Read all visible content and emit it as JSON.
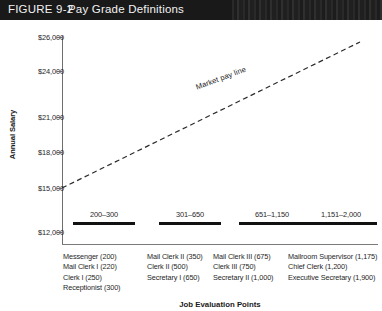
{
  "header": {
    "figure_label": "FIGURE 9-2",
    "title": "Pay Grade Definitions"
  },
  "chart_data": {
    "type": "scatter",
    "title": "Pay Grade Definitions",
    "xlabel": "Job Evaluation Points",
    "ylabel": "Annual Salary",
    "grid": false,
    "legend": false,
    "yticks": [
      "$26,000",
      "$24,000",
      "$21,000",
      "$18,000",
      "$15,000",
      "$12,000"
    ],
    "ytick_values": [
      26000,
      24000,
      21000,
      18000,
      15000,
      12000
    ],
    "ylim": [
      12000,
      26000
    ],
    "xlim": [
      0,
      2100
    ],
    "annotations": [
      {
        "text": "Market pay line",
        "type": "trend-line",
        "style": "dashed",
        "start": {
          "x": 200,
          "y": 15000
        },
        "end": {
          "x": 2000,
          "y": 25500
        }
      }
    ],
    "grades": [
      {
        "range_label": "200–300",
        "min_points": 200,
        "max_points": 300,
        "jobs": [
          "Messenger (200)",
          "Mail Clerk I (220)",
          "Clerk I (250)",
          "Receptionist (300)"
        ]
      },
      {
        "range_label": "301–650",
        "min_points": 301,
        "max_points": 650,
        "jobs": [
          "Mail Clerk II (350)",
          "Clerk II (500)",
          "Secretary I (650)"
        ]
      },
      {
        "range_label": "651–1,150",
        "min_points": 651,
        "max_points": 1150,
        "jobs": [
          "Mail Clerk III (675)",
          "Clerk III (750)",
          "Secretary II (1,000)"
        ]
      },
      {
        "range_label": "1,151–2,000",
        "min_points": 1151,
        "max_points": 2000,
        "jobs": [
          "Mailroom Supervisor (1,175)",
          "Chief Clerk (1,200)",
          "Executive Secretary (1,900)"
        ]
      }
    ]
  },
  "colors": {
    "header_background": "#191919",
    "header_text": "#f2f2f2",
    "axis": "#6e6e6e",
    "bar": "#111111",
    "text": "#1f1f1f"
  }
}
